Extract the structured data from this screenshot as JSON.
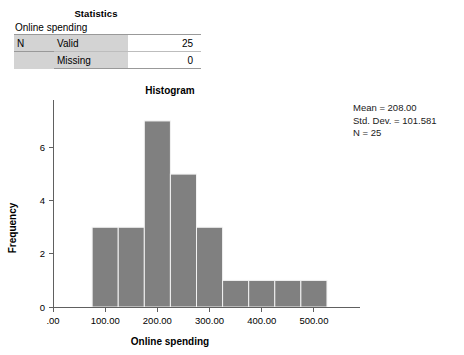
{
  "stats_table": {
    "title": "Statistics",
    "subtitle": "Online spending",
    "rows": [
      {
        "group": "N",
        "label": "Valid",
        "value": "25"
      },
      {
        "group": "",
        "label": "Missing",
        "value": "0"
      }
    ]
  },
  "chart": {
    "title": "Histogram",
    "annotation": {
      "mean": "Mean = 208.00",
      "std_dev": "Std. Dev. = 101.581",
      "n": "N = 25"
    }
  },
  "chart_data": {
    "type": "bar",
    "title": "Histogram",
    "xlabel": "Online spending",
    "ylabel": "Frequency",
    "xlim": [
      0,
      550
    ],
    "ylim": [
      0,
      7.6
    ],
    "grid": false,
    "legend": null,
    "bin_width": 50,
    "bin_starts": [
      75,
      125,
      175,
      225,
      275,
      325,
      375,
      425,
      475
    ],
    "values": [
      3,
      3,
      7,
      5,
      3,
      1,
      1,
      1,
      1
    ],
    "xticks": [
      0,
      100,
      200,
      300,
      400,
      500
    ],
    "xticklabels": [
      ".00",
      "100.00",
      "200.00",
      "300.00",
      "400.00",
      "500.00"
    ],
    "yticks": [
      0,
      2,
      4,
      6
    ],
    "yticklabels": [
      "0",
      "2",
      "4",
      "6"
    ],
    "annotations": [
      "Mean = 208.00",
      "Std. Dev. = 101.581",
      "N = 25"
    ],
    "bar_color": "#808080"
  }
}
